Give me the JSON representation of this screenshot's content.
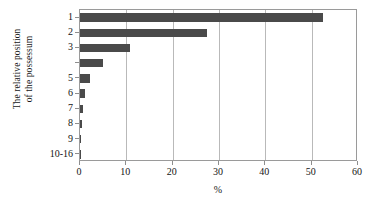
{
  "chart_data": {
    "type": "bar",
    "orientation": "horizontal",
    "title": "",
    "xlabel": "%",
    "ylabel": "The relative position of the possessum",
    "ylabel_lines": [
      "The relative position",
      "of the possessum"
    ],
    "categories": [
      "1",
      "2",
      "3",
      "",
      "5",
      "6",
      "7",
      "8",
      "9",
      "10-16"
    ],
    "values": [
      52.5,
      27.5,
      10.8,
      5.0,
      2.2,
      1.1,
      0.6,
      0.35,
      0.2,
      0.2
    ],
    "xlim": [
      0,
      60
    ],
    "xticks": [
      0,
      10,
      20,
      30,
      40,
      50,
      60
    ],
    "xtick_labels": [
      "0",
      "10",
      "20",
      "30",
      "40",
      "50",
      "60"
    ],
    "grid": "vertical",
    "legend": "none",
    "bar_color": "#4a4a4a",
    "frame_color": "#9a9a9a",
    "gridline_color": "#b9b9b9"
  }
}
